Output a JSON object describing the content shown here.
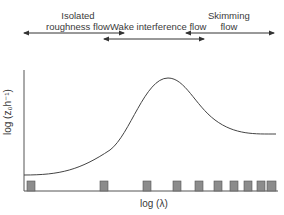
{
  "regimes": [
    {
      "label_line1": "Isolated",
      "label_line2": "roughness flow",
      "arrow_x_start": 24,
      "arrow_x_end": 124
    },
    {
      "label_line1": "Wake interference flow",
      "label_line2": "",
      "arrow_x_start": 104,
      "arrow_x_end": 204
    },
    {
      "label_line1": "Skimming",
      "label_line2": "flow",
      "arrow_x_start": 186,
      "arrow_x_end": 274
    }
  ],
  "axes": {
    "ylabel": "log (z₀h⁻¹)",
    "xlabel": "log (λ)"
  },
  "roughness_elements": {
    "count": 10,
    "x_positions": [
      27,
      100,
      143,
      173,
      195,
      214,
      230,
      244,
      257,
      267
    ],
    "color": "#8c8c8c"
  },
  "curve": {
    "description": "Roughness length rises from isolated regime, peaks in wake interference regime, declines to plateau in skimming regime",
    "color": "#444444"
  }
}
